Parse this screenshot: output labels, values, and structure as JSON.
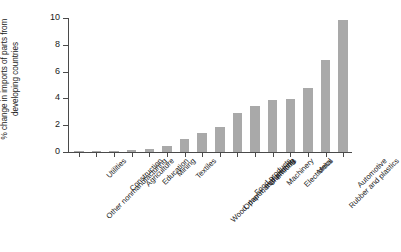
{
  "chart_data": {
    "type": "bar",
    "title": "",
    "xlabel": "",
    "ylabel": "% change in imports of parts from developing countries",
    "ylim": [
      0,
      10
    ],
    "yticks": [
      0,
      2,
      4,
      6,
      8,
      10
    ],
    "ytick_labels": [
      "0",
      "2",
      "4",
      "6",
      "8",
      "10"
    ],
    "grid": false,
    "legend": null,
    "bar_color": "#a9a9a9",
    "axis_color": "#4a4a4a",
    "categories": [
      "Other nonmanufacturing",
      "Utilities",
      "Construction",
      "Agriculture",
      "Education",
      "Mining",
      "Textiles",
      "Wood, paper, and printing",
      "Other manufacturing",
      "Food products",
      "Chemicals",
      "Machinery",
      "Electronics",
      "Metal",
      "Rubber and plastics",
      "Automotive"
    ],
    "values": [
      0.05,
      0.05,
      0.08,
      0.15,
      0.2,
      0.45,
      0.95,
      1.45,
      1.9,
      2.9,
      3.4,
      3.9,
      3.95,
      4.8,
      6.9,
      9.85
    ]
  }
}
